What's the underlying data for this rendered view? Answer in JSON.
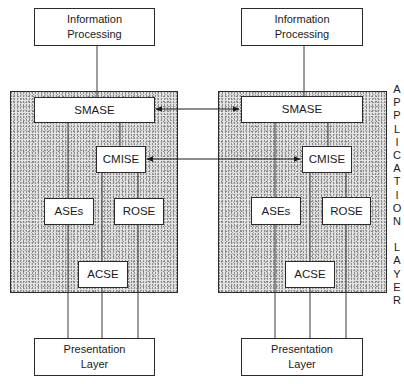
{
  "diagram": {
    "left_system": {
      "top": "Information\nProcessing",
      "smase": "SMASE",
      "cmise": "CMISE",
      "ases": "ASEs",
      "rose": "ROSE",
      "acse": "ACSE",
      "bottom": "Presentation\nLayer"
    },
    "right_system": {
      "top": "Information\nProcessing",
      "smase": "SMASE",
      "cmise": "CMISE",
      "ases": "ASEs",
      "rose": "ROSE",
      "acse": "ACSE",
      "bottom": "Presentation\nLayer"
    },
    "side_label_letters": [
      "A",
      "P",
      "P",
      "L",
      "I",
      "C",
      "A",
      "T",
      "I",
      "O",
      "N",
      " ",
      "L",
      "A",
      "Y",
      "E",
      "R"
    ],
    "side_label": "APPLICATION LAYER",
    "connections": [
      {
        "from": "left SMASE",
        "to": "right SMASE",
        "type": "bidirectional-arrow"
      },
      {
        "from": "left CMISE",
        "to": "right CMISE",
        "type": "bidirectional-arrow"
      }
    ],
    "colors": {
      "line": "#2a2a2a",
      "shade": "#e4e4e4",
      "box": "#ffffff"
    }
  }
}
